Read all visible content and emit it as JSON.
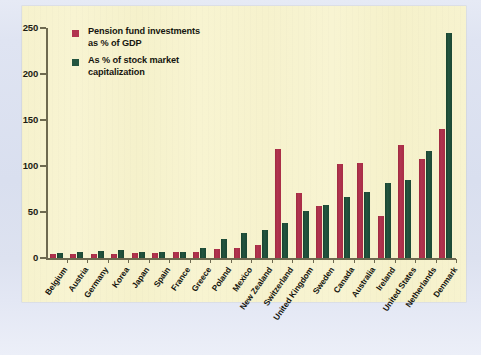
{
  "figure": {
    "plot_background": "#f7f3cf",
    "page_background": "#dee3f1",
    "axis_color": "#6e6a50"
  },
  "legend": {
    "position": "top-left-inside",
    "entries": [
      {
        "swatch_name": "legend-swatch-red",
        "color": "#b13450",
        "line1": "Pension fund investments",
        "line2": "as % of GDP"
      },
      {
        "swatch_name": "legend-swatch-green",
        "color": "#23543f",
        "line1": "As % of stock market",
        "line2": "capitalization"
      }
    ]
  },
  "axis": {
    "y_ticks": [
      "0",
      "50",
      "100",
      "150",
      "200",
      "250"
    ],
    "y_min": 0,
    "y_max": 250
  },
  "chart_data": {
    "type": "bar",
    "title": "",
    "subtitle": "",
    "xlabel": "",
    "ylabel": "",
    "ylim": [
      0,
      250
    ],
    "grid": false,
    "legend_position": "upper left",
    "orientation": "vertical",
    "grouping": "grouped",
    "categories": [
      "Belgium",
      "Austria",
      "Germany",
      "Korea",
      "Japan",
      "Spain",
      "France",
      "Greece",
      "Poland",
      "Mexico",
      "New Zealand",
      "Switzerland",
      "United Kingdom",
      "Sweden",
      "Canada",
      "Australia",
      "Ireland",
      "United States",
      "Netherlands",
      "Denmark"
    ],
    "series": [
      {
        "name": "Pension fund investments as % of GDP",
        "color": "#b13450",
        "values": [
          4,
          4,
          4,
          4,
          5,
          5,
          6,
          7,
          10,
          11,
          14,
          118,
          71,
          56,
          102,
          103,
          46,
          123,
          108,
          140
        ]
      },
      {
        "name": "As % of stock market capitalization",
        "color": "#23543f",
        "values": [
          5,
          7,
          8,
          9,
          6,
          6,
          7,
          11,
          21,
          27,
          30,
          38,
          51,
          58,
          66,
          72,
          82,
          85,
          116,
          245
        ]
      }
    ]
  }
}
